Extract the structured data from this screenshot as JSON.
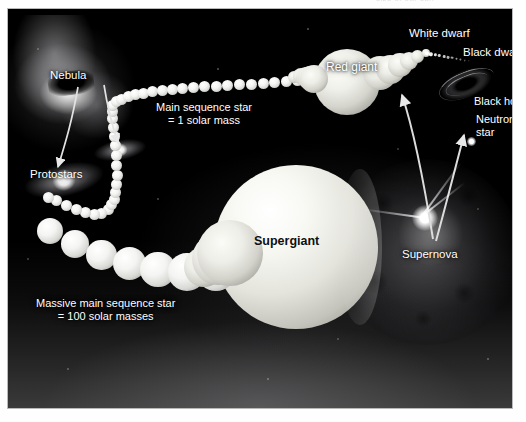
{
  "figure": {
    "top_caption": "size of our sun",
    "title_note": "Stellar evolution life-cycle diagram"
  },
  "labels": {
    "nebula": "Nebula",
    "protostars": "Protostars",
    "main_sequence_line1": "Main sequence star",
    "main_sequence_line2": "= 1 solar mass",
    "massive_line1": "Massive main sequence star",
    "massive_line2": "= 100 solar masses",
    "red_giant": "Red giant",
    "white_dwarf": "White dwarf",
    "black_dwarf": "Black dwarf",
    "supergiant": "Supergiant",
    "supernova": "Supernova",
    "black_hole": "Black hole",
    "neutron_star_line1": "Neutron",
    "neutron_star_line2": "star"
  },
  "stages": [
    {
      "id": "nebula",
      "name": "Nebula",
      "track": "origin"
    },
    {
      "id": "protostars",
      "name": "Protostars",
      "track": "origin"
    },
    {
      "id": "main-sequence-star",
      "name": "Main sequence star",
      "mass": "1 solar mass",
      "track": "low-mass"
    },
    {
      "id": "red-giant",
      "name": "Red giant",
      "track": "low-mass"
    },
    {
      "id": "white-dwarf",
      "name": "White dwarf",
      "track": "low-mass"
    },
    {
      "id": "black-dwarf",
      "name": "Black dwarf",
      "track": "low-mass"
    },
    {
      "id": "massive-main-sequence-star",
      "name": "Massive main sequence star",
      "mass": "100 solar masses",
      "track": "high-mass"
    },
    {
      "id": "supergiant",
      "name": "Supergiant",
      "track": "high-mass"
    },
    {
      "id": "supernova",
      "name": "Supernova",
      "track": "high-mass"
    },
    {
      "id": "neutron-star",
      "name": "Neutron star",
      "track": "high-mass-remnant"
    },
    {
      "id": "black-hole",
      "name": "Black hole",
      "track": "high-mass-remnant"
    }
  ],
  "colors": {
    "background": "#000000",
    "page": "#ffffff",
    "label_light": "#ffffff",
    "label_dark": "#101010",
    "star_body": "#f4f4f2",
    "frame_border": "#b9b9b9"
  },
  "geometry": {
    "main_sequence_dots": 34,
    "massive_chain_spheres": 7,
    "red_giant_growth_spheres": 5,
    "dwarf_shrink_spheres": 6,
    "dwarf_trail_dots": 11
  }
}
